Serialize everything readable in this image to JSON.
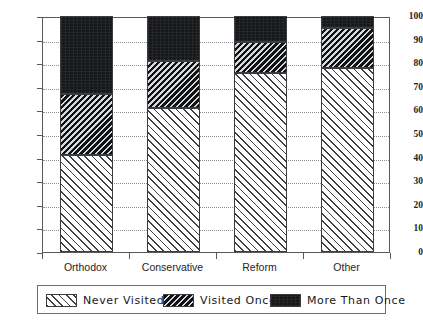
{
  "chart_data": {
    "type": "bar",
    "subtype": "stacked-bar-100",
    "title": "",
    "subtitle": "",
    "xlabel": "",
    "ylabel": "",
    "ylim": [
      0,
      100
    ],
    "yticks": [
      0,
      10,
      20,
      30,
      40,
      50,
      60,
      70,
      80,
      90,
      100
    ],
    "ytick_labels": [
      "0",
      "10",
      "20",
      "30",
      "40",
      "50",
      "60",
      "70",
      "80",
      "90",
      "100"
    ],
    "grid": true,
    "grid_axis": "y",
    "legend_position": "bottom",
    "categories": [
      "Orthodox",
      "Conservative",
      "Reform",
      "Other"
    ],
    "series": [
      {
        "name": "Never Visited",
        "values": [
          41,
          61,
          76,
          78
        ],
        "pattern": "diagonal-hatch-light",
        "color": "#FFFFFF"
      },
      {
        "name": "Visited Once",
        "values": [
          26,
          20,
          13,
          17
        ],
        "pattern": "diagonal-hatch-dark",
        "color": "#6D7075"
      },
      {
        "name": "More Than Once",
        "values": [
          33,
          19,
          11,
          5
        ],
        "pattern": "solid",
        "color": "#16181A"
      }
    ],
    "cumulative_tops": [
      {
        "category": "Orthodox",
        "never": 41,
        "through_once": 67,
        "total": 100
      },
      {
        "category": "Conservative",
        "never": 61,
        "through_once": 81,
        "total": 100
      },
      {
        "category": "Reform",
        "never": 76,
        "through_once": 89,
        "total": 100
      },
      {
        "category": "Other",
        "never": 78,
        "through_once": 95,
        "total": 100
      }
    ]
  },
  "axis": {
    "y_ticks": [
      {
        "label": "100",
        "value": 100
      },
      {
        "label": "90",
        "value": 90
      },
      {
        "label": "80",
        "value": 80
      },
      {
        "label": "70",
        "value": 70
      },
      {
        "label": "60",
        "value": 60
      },
      {
        "label": "50",
        "value": 50
      },
      {
        "label": "40",
        "value": 40
      },
      {
        "label": "30",
        "value": 30
      },
      {
        "label": "20",
        "value": 20
      },
      {
        "label": "10",
        "value": 10
      },
      {
        "label": "0",
        "value": 0
      }
    ],
    "x_ticks": [
      {
        "label": "Orthodox"
      },
      {
        "label": "Conservative"
      },
      {
        "label": "Reform"
      },
      {
        "label": "Other"
      }
    ]
  },
  "legend": {
    "items": [
      {
        "label": "Never Visited",
        "swatch": "hatch-light-swatch"
      },
      {
        "label": "Visited Once",
        "swatch": "hatch-dark-swatch"
      },
      {
        "label": "More Than Once",
        "swatch": "solid-black-swatch"
      }
    ]
  },
  "colors": {
    "axis": "#55585C",
    "grid": "#8D9094",
    "segment_never": "#FFFFFF",
    "segment_once": "#6D7075",
    "segment_more": "#16181A",
    "text": "#232529"
  }
}
